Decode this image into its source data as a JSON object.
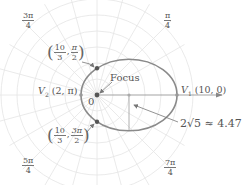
{
  "diagram": {
    "colors": {
      "grid": "#e2e2e2",
      "ellipse": "#8a8a8a",
      "axis": "#999999",
      "point": "#555555",
      "text": "#555555"
    },
    "angle_labels": [
      {
        "id": "pi_over_4",
        "num": "π",
        "den": "4"
      },
      {
        "id": "3pi_over_4",
        "num": "3π",
        "den": "4"
      },
      {
        "id": "5pi_over_4",
        "num": "5π",
        "den": "4"
      },
      {
        "id": "7pi_over_4",
        "num": "7π",
        "den": "4"
      }
    ],
    "points": {
      "top": {
        "r_num": "10",
        "r_den": "3",
        "theta_num": "π",
        "theta_den": "2"
      },
      "bottom": {
        "r_num": "10",
        "r_den": "3",
        "theta_num": "3π",
        "theta_den": "2"
      },
      "v1": {
        "name": "V",
        "sub": "1",
        "coords": "(10, 0)"
      },
      "v2": {
        "name": "V",
        "sub": "2",
        "coords": "(2, π)"
      }
    },
    "focus_label": "Focus",
    "origin_label": "0",
    "minor_axis_label": "2√5 ≈ 4.47"
  }
}
